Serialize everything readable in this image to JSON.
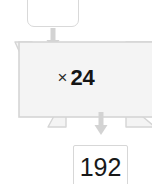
{
  "diagram": {
    "type": "function-machine",
    "title": "",
    "input_box": {
      "value": "",
      "placeholder": ""
    },
    "operation_banner": {
      "sign": "×",
      "value": "24",
      "full_label": "× 24",
      "fill_color": "#f4f4f4",
      "border_color": "#d5d5d5"
    },
    "output_box": {
      "value": "192"
    },
    "arrows": {
      "top": "arrow-down",
      "bottom": "arrow-down",
      "color": "#d2d2d2"
    }
  }
}
